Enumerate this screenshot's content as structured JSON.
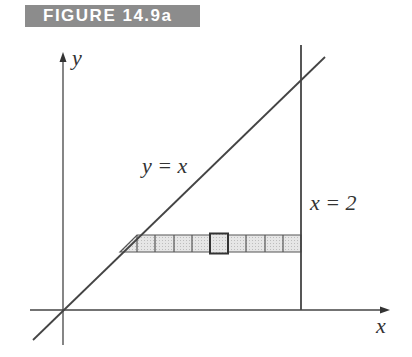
{
  "figure": {
    "title": "FIGURE 14.9a"
  },
  "labels": {
    "y_axis": "y",
    "x_axis": "x",
    "line_diag": "y = x",
    "line_vert": "x = 2"
  },
  "geometry": {
    "origin": [
      63,
      310
    ],
    "x_axis": {
      "x1": 30,
      "x2": 390,
      "y": 310
    },
    "y_axis": {
      "x": 63,
      "y1": 345,
      "y2": 52
    },
    "diag_line": {
      "x1": 33,
      "y1": 340,
      "x2": 325,
      "y2": 57
    },
    "vert_line": {
      "x": 301,
      "y1": 45,
      "y2": 310
    },
    "strip": {
      "y_top": 235,
      "y_bottom": 252,
      "x_right": 301,
      "cell_divisions": [
        137,
        155,
        174,
        192,
        210,
        228,
        246,
        265,
        283
      ],
      "highlight_cell": [
        210,
        228
      ]
    },
    "colors": {
      "line": "#444444",
      "strip_fill": "#d9d9d9",
      "banner_bg": "#8c8c8c",
      "banner_text": "#ffffff"
    }
  }
}
